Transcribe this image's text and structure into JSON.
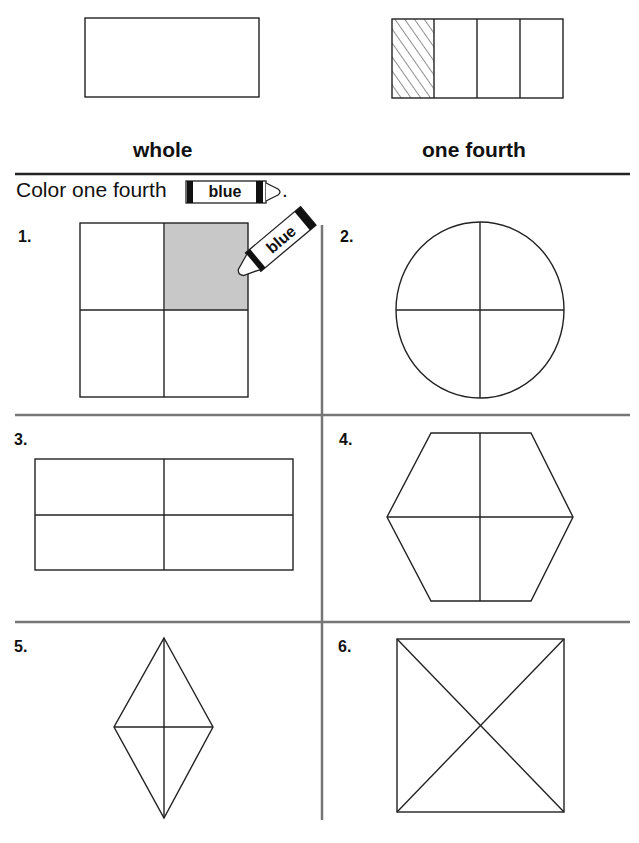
{
  "examples": {
    "whole_label": "whole",
    "fourth_label": "one fourth"
  },
  "instruction": {
    "text": "Color one fourth",
    "crayon_label": "blue",
    "period": "."
  },
  "problems": [
    {
      "number": "1.",
      "shape": "square",
      "parts": 4,
      "shaded": "top-right",
      "crayon_label": "blue"
    },
    {
      "number": "2.",
      "shape": "circle",
      "parts": 4
    },
    {
      "number": "3.",
      "shape": "rectangle",
      "parts": 4
    },
    {
      "number": "4.",
      "shape": "hexagon",
      "parts": 4
    },
    {
      "number": "5.",
      "shape": "rhombus",
      "parts": 4
    },
    {
      "number": "6.",
      "shape": "rectangle-diagonals",
      "parts": 4
    }
  ],
  "colors": {
    "ink": "#1a1a1a",
    "divider": "#777777",
    "shade": "#c8c8c8"
  }
}
